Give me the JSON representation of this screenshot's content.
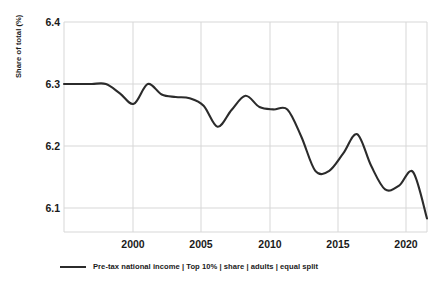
{
  "chart_data": {
    "type": "line",
    "title": "",
    "subtitle": "",
    "xlabel": "",
    "ylabel": "Share of total (%)",
    "xlim": [
      1995,
      2021
    ],
    "ylim": [
      6.06,
      6.42
    ],
    "grid": true,
    "legend_position": "bottom-left",
    "x_ticks": [
      "2000",
      "2005",
      "2010",
      "2015",
      "2020"
    ],
    "x_tick_values": [
      2000,
      2005,
      2010,
      2015,
      2020
    ],
    "y_ticks": [
      "6.4",
      "6.3",
      "6.2",
      "6.1"
    ],
    "y_tick_values": [
      6.4,
      6.3,
      6.2,
      6.1
    ],
    "series": [
      {
        "name": "Pre-tax national income | Top 10% | share | adults | equal split",
        "color": "#2b2b2b",
        "x": [
          1995,
          1996,
          1997,
          1998,
          1999,
          2000,
          2001,
          2002,
          2003,
          2004,
          2005,
          2006,
          2007,
          2008,
          2009,
          2010,
          2011,
          2012,
          2013,
          2014,
          2015,
          2016,
          2017,
          2018,
          2019,
          2020,
          2021
        ],
        "values": [
          6.3,
          6.3,
          6.3,
          6.3,
          6.285,
          6.268,
          6.3,
          6.283,
          6.279,
          6.277,
          6.265,
          6.231,
          6.258,
          6.281,
          6.263,
          6.259,
          6.259,
          6.215,
          6.16,
          6.16,
          6.188,
          6.219,
          6.168,
          6.13,
          6.136,
          6.158,
          6.083
        ]
      }
    ]
  },
  "axes": {
    "y_title": "Share of total (%)",
    "y_tick_labels": [
      "6.4",
      "6.3",
      "6.2",
      "6.1"
    ],
    "x_tick_labels": [
      "2000",
      "2005",
      "2010",
      "2015",
      "2020"
    ]
  },
  "legend": {
    "items": [
      {
        "label": "Pre-tax national income | Top 10% | share | adults | equal split",
        "color": "#2b2b2b"
      }
    ]
  },
  "colors": {
    "line": "#2b2b2b",
    "grid": "#d7d7d7",
    "text": "#1a1a1a",
    "background": "#ffffff"
  }
}
